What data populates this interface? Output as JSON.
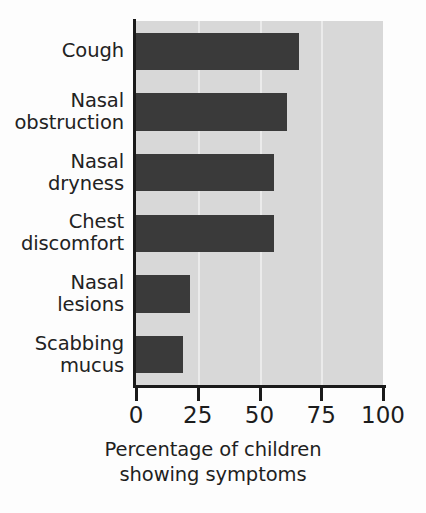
{
  "chart_data": {
    "type": "bar",
    "orientation": "horizontal",
    "title": "",
    "xlabel": "Percentage of children showing symptoms",
    "ylabel": "",
    "categories": [
      "Cough",
      "Nasal obstruction",
      "Nasal dryness",
      "Chest discomfort",
      "Nasal lesions",
      "Scabbing mucus"
    ],
    "category_lines": [
      "Cough",
      "Nasal\nobstruction",
      "Nasal\ndryness",
      "Chest\ndiscomfort",
      "Nasal\nlesions",
      "Scabbing\nmucus"
    ],
    "values": [
      66,
      61,
      56,
      56,
      22,
      19
    ],
    "xlim": [
      0,
      100
    ],
    "xticks": [
      0,
      25,
      50,
      75,
      100
    ],
    "xtick_labels": [
      "0",
      "25",
      "50",
      "75",
      "100"
    ],
    "grid": true,
    "gridline_values": [
      25,
      50,
      75
    ],
    "legend": "none",
    "bar_color": "#3a3a3a",
    "plot_background": "#d8d8d8",
    "gridline_color": "#efefef",
    "axis_color": "#1a1a1a"
  },
  "axis_title": {
    "line1": "Percentage of children",
    "line2": "showing symptoms"
  }
}
